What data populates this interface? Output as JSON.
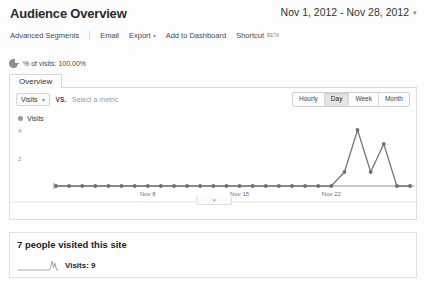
{
  "header": {
    "title": "Audience Overview",
    "date_range": "Nov 1, 2012 - Nov 28, 2012",
    "date_caret": "▾"
  },
  "toolbar": {
    "items": [
      {
        "label": "Advanced Segments",
        "caret": ""
      },
      {
        "label": "Email",
        "caret": ""
      },
      {
        "label": "Export",
        "caret": "▾"
      },
      {
        "label": "Add to Dashboard",
        "caret": ""
      },
      {
        "label": "Shortcut",
        "caret": ""
      }
    ],
    "shortcut_badge": "BETA"
  },
  "segment": {
    "icon": "pie-chart-icon",
    "label": "% of visits: 100.00%"
  },
  "tabs": [
    {
      "label": "Overview",
      "selected": true
    }
  ],
  "metric_controls": {
    "primary_metric": "Visits",
    "primary_caret": "▾",
    "vs_label": "VS.",
    "secondary_placeholder": "Select a metric"
  },
  "granularity": {
    "options": [
      "Hourly",
      "Day",
      "Week",
      "Month"
    ],
    "selected": "Day"
  },
  "legend": {
    "series_label": "Visits"
  },
  "chart_data": {
    "type": "line",
    "title": "Visits",
    "xlabel": "",
    "ylabel": "",
    "grid": false,
    "legend_position": "top-left",
    "ylim": [
      0,
      4
    ],
    "ytick_labels": [
      "2",
      "4"
    ],
    "ytick_values": [
      2,
      4
    ],
    "xtick_labels": [
      "Nov 8",
      "Nov 15",
      "Nov 22"
    ],
    "xtick_indices": [
      7,
      14,
      21
    ],
    "x": [
      "Nov 1",
      "Nov 2",
      "Nov 3",
      "Nov 4",
      "Nov 5",
      "Nov 6",
      "Nov 7",
      "Nov 8",
      "Nov 9",
      "Nov 10",
      "Nov 11",
      "Nov 12",
      "Nov 13",
      "Nov 14",
      "Nov 15",
      "Nov 16",
      "Nov 17",
      "Nov 18",
      "Nov 19",
      "Nov 20",
      "Nov 21",
      "Nov 22",
      "Nov 23",
      "Nov 24",
      "Nov 25",
      "Nov 26",
      "Nov 27",
      "Nov 28"
    ],
    "series": [
      {
        "name": "Visits",
        "values": [
          0,
          0,
          0,
          0,
          0,
          0,
          0,
          0,
          0,
          0,
          0,
          0,
          0,
          0,
          0,
          0,
          0,
          0,
          0,
          0,
          0,
          0,
          1,
          4,
          1,
          3,
          0,
          0
        ]
      }
    ],
    "line_color": "#777777",
    "marker_color": "#6f6f6f"
  },
  "axis_collapse": {
    "glyph": "▾"
  },
  "summary": {
    "headline": "7 people visited this site",
    "metric_label": "Visits: 9",
    "sparkline_values": [
      0,
      0,
      0,
      0,
      0,
      0,
      0,
      0,
      0,
      0,
      0,
      0,
      0,
      0,
      0,
      0,
      0,
      0,
      0,
      0,
      0,
      0,
      1,
      4,
      1,
      3,
      0,
      0
    ]
  }
}
